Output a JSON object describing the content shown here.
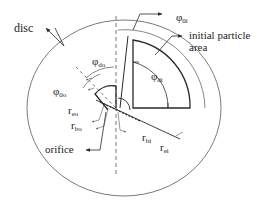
{
  "diagram": {
    "title": "",
    "colors": {
      "line": "#2a2a2a",
      "outer_circle": "#7a7a7a",
      "text": "#222222"
    },
    "labels": {
      "disc": "disc",
      "initial_particle_area_line1": "initial particle",
      "initial_particle_area_line2": "area",
      "orifice": "orifice",
      "phi_0i": {
        "sym": "φ",
        "sub": "0i"
      },
      "phi_di": {
        "sym": "φ",
        "sub": "di"
      },
      "phi_do": {
        "sym": "φ",
        "sub": "do"
      },
      "phi_0o": {
        "sym": "φ",
        "sub": "0o"
      },
      "r_eo": {
        "sym": "r",
        "sub": "eo"
      },
      "r_bo": {
        "sym": "r",
        "sub": "bo"
      },
      "r_bi": {
        "sym": "r",
        "sub": "bi"
      },
      "r_ei": {
        "sym": "r",
        "sub": "ei"
      }
    }
  }
}
